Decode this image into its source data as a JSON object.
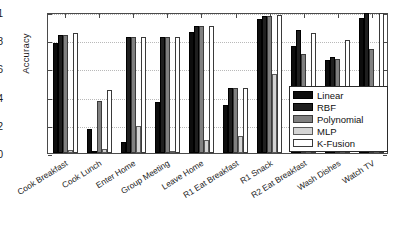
{
  "chart_data": {
    "type": "bar",
    "title": "",
    "xlabel": "",
    "ylabel": "Accuracy",
    "ylim": [
      0,
      1
    ],
    "yticks": [
      0,
      0.2,
      0.4,
      0.6,
      0.8,
      1
    ],
    "ytick_labels": [
      "0",
      "0.2",
      "0.4",
      "0.6",
      "0.8",
      "1"
    ],
    "grid": true,
    "legend_position": "lower-right",
    "categories": [
      "Cook Breakfast",
      "Cook Lunch",
      "Enter Home",
      "Group Meeting",
      "Leave Home",
      "R1 Eat Breakfast",
      "R1 Snack",
      "R2 Eat Breakfast",
      "Wash Dishes",
      "Watch TV"
    ],
    "series": [
      {
        "name": "Linear",
        "color": "#0d0d0d",
        "values": [
          0.78,
          0.17,
          0.08,
          0.36,
          0.86,
          0.34,
          0.95,
          0.76,
          0.66,
          0.96
        ]
      },
      {
        "name": "RBF",
        "color": "#1f1f1f",
        "values": [
          0.84,
          0.01,
          0.82,
          0.82,
          0.9,
          0.46,
          0.97,
          0.87,
          0.68,
          0.99
        ]
      },
      {
        "name": "Polynomial",
        "color": "#808080",
        "values": [
          0.84,
          0.37,
          0.82,
          0.82,
          0.9,
          0.46,
          0.97,
          0.7,
          0.67,
          0.74
        ]
      },
      {
        "name": "MLP",
        "color": "#d4d4d4",
        "values": [
          0.02,
          0.03,
          0.19,
          0.01,
          0.09,
          0.12,
          0.56,
          0.01,
          0.01,
          0.01
        ]
      },
      {
        "name": "K-Fusion",
        "color": "#ffffff",
        "values": [
          0.85,
          0.45,
          0.82,
          0.82,
          0.9,
          0.46,
          0.98,
          0.85,
          0.8,
          0.99
        ]
      }
    ]
  }
}
